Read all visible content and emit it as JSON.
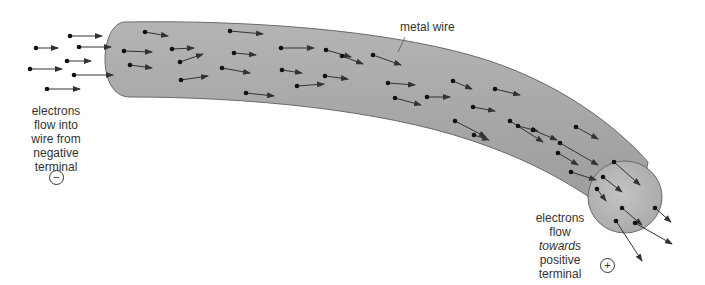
{
  "diagram": {
    "wire_label": "metal wire",
    "left_label": [
      "electrons",
      "flow into",
      "wire from",
      "negative",
      "terminal"
    ],
    "right_label": [
      "electrons",
      "flow",
      "towards",
      "positive",
      "terminal"
    ],
    "negative_symbol": "−",
    "positive_symbol": "+",
    "colors": {
      "wire_fill": "#a8a8a8",
      "wire_end": "#b8b8b8",
      "outline": "#6a6a6a",
      "electron": "#111111",
      "arrow": "#333333"
    }
  }
}
